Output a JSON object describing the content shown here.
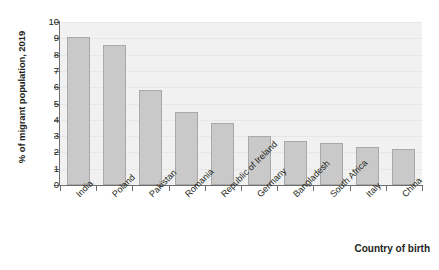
{
  "chart_data": {
    "type": "bar",
    "title": "",
    "xlabel": "Country of birth",
    "ylabel": "% of migrant population, 2019",
    "categories": [
      "India",
      "Poland",
      "Pakistan",
      "Romania",
      "Republic of Ireland",
      "Germany",
      "Bangladesh",
      "South Africa",
      "Italy",
      "China"
    ],
    "values": [
      9.1,
      8.6,
      5.8,
      4.5,
      3.8,
      3.0,
      2.7,
      2.6,
      2.35,
      2.2
    ],
    "ylim": [
      0,
      10
    ],
    "ytick_labels": [
      "10",
      "9",
      "8",
      "7",
      "6",
      "5",
      "4",
      "3",
      "2",
      "1",
      "0"
    ],
    "ytick_values": [
      10,
      9,
      8,
      7,
      6,
      5,
      4,
      3,
      2,
      1,
      0
    ],
    "grid": true,
    "legend": false,
    "colors": {
      "bar_fill": "#c9c9c9",
      "bar_stroke": "#a9a9a9",
      "plot_background": "#f1f1f1",
      "axis": "#6e6e6e",
      "gridline": "#e7e7e7",
      "text": "#231f20",
      "page_background": "#ffffff"
    }
  }
}
